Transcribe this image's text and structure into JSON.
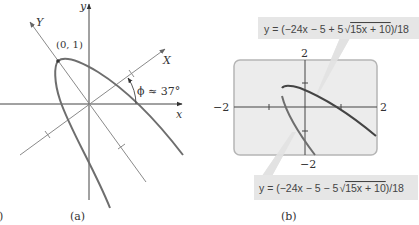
{
  "panel_a": {
    "caption": "(a)",
    "left_fragment": ")",
    "axis_x_label": "x",
    "axis_y_label": "y",
    "rotated_x_label": "X",
    "rotated_y_label": "Y",
    "vertex_label": "(0, 1)",
    "angle_label": "ϕ ≈ 37°"
  },
  "panel_b": {
    "caption": "(b)",
    "upper_equation": "y = (−24x − 5 + 5√(15x + 10))/18",
    "upper_eq_prefix": "y = (−24x − 5 + 5",
    "upper_eq_radicand": "15x + 10",
    "upper_eq_suffix": ")/18",
    "lower_equation": "y = (−24x − 5 − 5√(15x + 10))/18",
    "lower_eq_prefix": "y = (−24x − 5 − 5",
    "lower_eq_radicand": "15x + 10",
    "lower_eq_suffix": ")/18",
    "window": {
      "xmin_label": "−2",
      "xmax_label": "2",
      "ymin_label": "−2",
      "ymax_label": "2"
    }
  },
  "colors": {
    "axis": "#555555",
    "rotated_axis": "#8a8a8a",
    "curve": "#6e6e6e",
    "screen_bg": "#ececec",
    "screen_border": "#b5b5b5",
    "label_box_bg": "#e6e6e6",
    "callout": "#e2e2e2"
  }
}
